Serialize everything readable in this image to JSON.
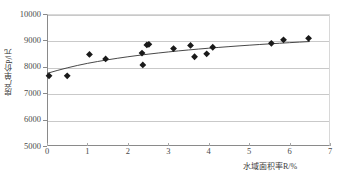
{
  "chart_data": {
    "type": "scatter",
    "title": "",
    "xlabel": "水域面积率R/%",
    "ylabel": "房产单价P/元",
    "xlim": [
      0,
      7
    ],
    "ylim": [
      5000,
      10000
    ],
    "xticks": [
      0,
      1,
      2,
      3,
      4,
      5,
      6,
      7
    ],
    "xtick_labels": [
      "0",
      "1",
      "2",
      "3",
      "4",
      "5",
      "6",
      "7"
    ],
    "yticks": [
      5000,
      6000,
      7000,
      8000,
      9000,
      10000
    ],
    "ytick_labels": [
      "5000",
      "6000",
      "7000",
      "8000",
      "9000",
      "10000"
    ],
    "grid": "horizontal",
    "legend": null,
    "marker": {
      "shape": "diamond",
      "color": "#1a1a1a",
      "size": 3.4
    },
    "points": [
      {
        "x": 0.05,
        "y": 7660
      },
      {
        "x": 0.5,
        "y": 7660
      },
      {
        "x": 1.05,
        "y": 8470
      },
      {
        "x": 1.45,
        "y": 8300
      },
      {
        "x": 2.35,
        "y": 8520
      },
      {
        "x": 2.37,
        "y": 8070
      },
      {
        "x": 2.47,
        "y": 8830
      },
      {
        "x": 2.52,
        "y": 8850
      },
      {
        "x": 3.13,
        "y": 8690
      },
      {
        "x": 3.55,
        "y": 8810
      },
      {
        "x": 3.65,
        "y": 8380
      },
      {
        "x": 3.95,
        "y": 8490
      },
      {
        "x": 4.1,
        "y": 8740
      },
      {
        "x": 5.55,
        "y": 8890
      },
      {
        "x": 5.85,
        "y": 9020
      },
      {
        "x": 6.47,
        "y": 9080
      }
    ],
    "fit_curve": {
      "name": "trend-line",
      "color": "#333333",
      "width": 0.9,
      "points": [
        {
          "x": 0.0,
          "y": 7750
        },
        {
          "x": 0.25,
          "y": 7860
        },
        {
          "x": 0.5,
          "y": 7960
        },
        {
          "x": 0.75,
          "y": 8050
        },
        {
          "x": 1.0,
          "y": 8130
        },
        {
          "x": 1.25,
          "y": 8200
        },
        {
          "x": 1.5,
          "y": 8265
        },
        {
          "x": 1.75,
          "y": 8325
        },
        {
          "x": 2.0,
          "y": 8380
        },
        {
          "x": 2.25,
          "y": 8430
        },
        {
          "x": 2.5,
          "y": 8478
        },
        {
          "x": 2.75,
          "y": 8522
        },
        {
          "x": 3.0,
          "y": 8563
        },
        {
          "x": 3.25,
          "y": 8602
        },
        {
          "x": 3.5,
          "y": 8638
        },
        {
          "x": 3.75,
          "y": 8672
        },
        {
          "x": 4.0,
          "y": 8704
        },
        {
          "x": 4.25,
          "y": 8735
        },
        {
          "x": 4.5,
          "y": 8764
        },
        {
          "x": 4.75,
          "y": 8792
        },
        {
          "x": 5.0,
          "y": 8818
        },
        {
          "x": 5.25,
          "y": 8844
        },
        {
          "x": 5.5,
          "y": 8868
        },
        {
          "x": 5.75,
          "y": 8891
        },
        {
          "x": 6.0,
          "y": 8914
        },
        {
          "x": 6.25,
          "y": 8936
        },
        {
          "x": 6.5,
          "y": 8957
        }
      ]
    }
  }
}
